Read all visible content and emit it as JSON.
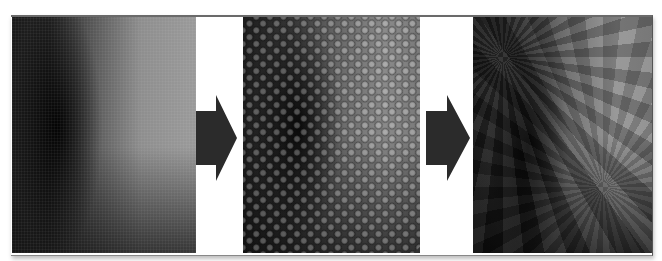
{
  "figure": {
    "panels": [
      {
        "id": "panel-1",
        "description": "smooth gradient texture (grayscale)"
      },
      {
        "id": "panel-2",
        "description": "regular dot-grid / dimpled pattern texture"
      },
      {
        "id": "panel-3",
        "description": "starburst / radial crystalline pattern texture"
      }
    ],
    "arrows": [
      {
        "id": "arrow-1",
        "direction": "right",
        "color": "#2b2b2b"
      },
      {
        "id": "arrow-2",
        "direction": "right",
        "color": "#2b2b2b"
      }
    ],
    "colors": {
      "background": "#ffffff",
      "arrow": "#2b2b2b",
      "frame_border": "#6a6a6a"
    }
  }
}
